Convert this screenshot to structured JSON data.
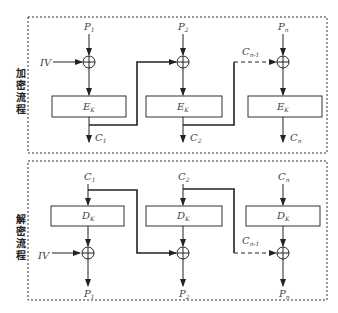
{
  "diagram": {
    "encryption": {
      "side_label": [
        "加",
        "密",
        "流",
        "程"
      ],
      "iv_label": "IV",
      "blocks": [
        {
          "plain": "P",
          "plain_sub": "1",
          "cipher_func": "E",
          "cipher_sub": "K",
          "out": "C",
          "out_sub": "1"
        },
        {
          "plain": "P",
          "plain_sub": "2",
          "cipher_func": "E",
          "cipher_sub": "K",
          "out": "C",
          "out_sub": "2"
        },
        {
          "plain": "P",
          "plain_sub": "n",
          "cipher_func": "E",
          "cipher_sub": "K",
          "out": "C",
          "out_sub": "n"
        }
      ],
      "chain_label": "C",
      "chain_sub": "n-1"
    },
    "decryption": {
      "side_label": [
        "解",
        "密",
        "流",
        "程"
      ],
      "iv_label": "IV",
      "blocks": [
        {
          "in": "C",
          "in_sub": "1",
          "cipher_func": "D",
          "cipher_sub": "K",
          "out": "P",
          "out_sub": "1"
        },
        {
          "in": "C",
          "in_sub": "2",
          "cipher_func": "D",
          "cipher_sub": "K",
          "out": "P",
          "out_sub": "2"
        },
        {
          "in": "C",
          "in_sub": "n",
          "cipher_func": "D",
          "cipher_sub": "K",
          "out": "P",
          "out_sub": "n"
        }
      ],
      "chain_label": "C",
      "chain_sub": "n-1"
    }
  }
}
